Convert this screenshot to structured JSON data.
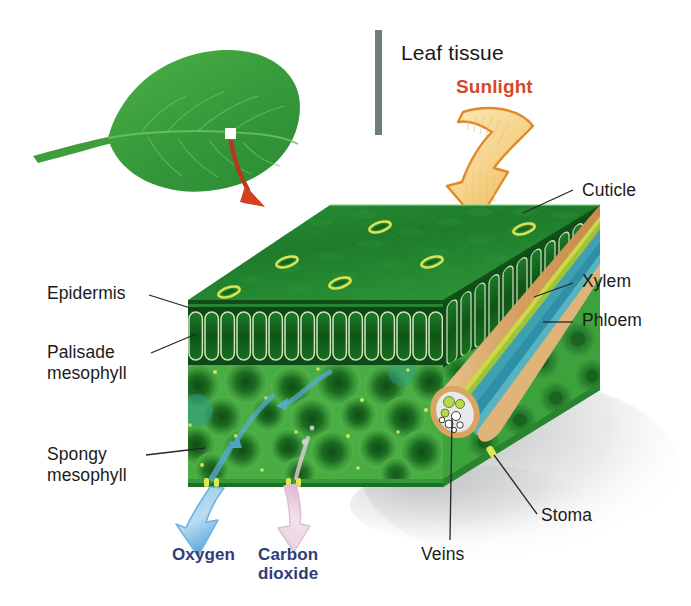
{
  "figure": {
    "title": "Leaf tissue",
    "background_color": "#ffffff",
    "title_rule_color": "#6d8076"
  },
  "energy": {
    "sunlight_label": "Sunlight",
    "sunlight_color": "#d4492a",
    "sunlight_arrow_fill": "#f4d898",
    "sunlight_arrow_stroke": "#e08a22"
  },
  "callout": {
    "marker_name": "leaf-sample-marker",
    "arrow_color": "#c0392b"
  },
  "labels": {
    "cuticle": "Cuticle",
    "xylem": "Xylem",
    "phloem": "Phloem",
    "epidermis": "Epidermis",
    "palisade": "Palisade\nmesophyll",
    "spongy": "Spongy\nmesophyll",
    "stoma": "Stoma",
    "veins": "Veins"
  },
  "gases": {
    "oxygen": "Oxygen",
    "carbon_dioxide": "Carbon\ndioxide",
    "text_color": "#2e3c79",
    "oxygen_arrow_color": "#6fb5e0",
    "carbon_dioxide_arrow_color": "#e6c4d6"
  },
  "palette": {
    "leaf_green": "#3fa03b",
    "top_surface_dark": "#1f7a2e",
    "top_surface_light": "#2f9a3c",
    "palisade_dark": "#16601f",
    "palisade_wall": "#c9ddb8",
    "spongy_mid": "#4cad45",
    "spongy_core": "#1d6b22",
    "vein_sheath": "#d9a96a",
    "xylem_color": "#c8d842",
    "phloem_color": "#3f9fb0",
    "stoma_color": "#d8e04a",
    "shadow_color": "#b9bcbd"
  },
  "structure": {
    "layers": [
      "cuticle",
      "upper epidermis",
      "palisade mesophyll",
      "spongy mesophyll",
      "lower epidermis",
      "vascular bundle"
    ],
    "stomata_count_top": 6
  }
}
